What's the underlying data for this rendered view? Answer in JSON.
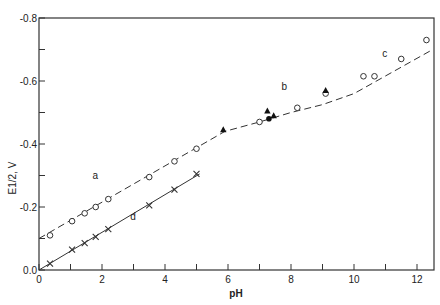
{
  "chart_data": {
    "type": "scatter",
    "title": "",
    "xlabel": "pH",
    "ylabel": "E1/2, V",
    "xlim": [
      0,
      12.5
    ],
    "ylim": [
      0.0,
      -0.8
    ],
    "x_ticks": [
      0,
      2,
      4,
      6,
      8,
      10,
      12
    ],
    "x_minor_ticks": [
      1,
      3,
      5,
      7,
      9,
      11
    ],
    "y_ticks": [
      "0.0",
      "-0.2",
      "-0.4",
      "-0.6",
      "-0.8"
    ],
    "y_tick_values": [
      0.0,
      -0.2,
      -0.4,
      -0.6,
      -0.8
    ],
    "y_minor_ticks": [
      -0.1,
      -0.3,
      -0.5,
      -0.7
    ],
    "grid": false,
    "annotations": [
      {
        "text": "a",
        "x": 1.7,
        "y": -0.29
      },
      {
        "text": "b",
        "x": 7.7,
        "y": -0.57
      },
      {
        "text": "c",
        "x": 10.9,
        "y": -0.675
      },
      {
        "text": "d",
        "x": 2.9,
        "y": -0.16
      }
    ],
    "series": [
      {
        "name": "a",
        "marker": "open-circle",
        "x": [
          0.35,
          1.05,
          1.45,
          1.8,
          2.2,
          3.5,
          4.3,
          5.0
        ],
        "y": [
          -0.11,
          -0.155,
          -0.18,
          -0.2,
          -0.225,
          -0.295,
          -0.345,
          -0.385
        ]
      },
      {
        "name": "d",
        "marker": "cross",
        "x": [
          0.35,
          1.05,
          1.45,
          1.8,
          2.2,
          3.5,
          4.3,
          5.0
        ],
        "y": [
          -0.02,
          -0.065,
          -0.085,
          -0.105,
          -0.13,
          -0.205,
          -0.255,
          -0.305
        ]
      },
      {
        "name": "b-circles",
        "marker": "open-circle",
        "x": [
          7.0,
          8.2,
          9.1
        ],
        "y": [
          -0.47,
          -0.515,
          -0.56
        ]
      },
      {
        "name": "b-triangles",
        "marker": "filled-triangle",
        "x": [
          5.85,
          7.25,
          7.45,
          9.1
        ],
        "y": [
          -0.445,
          -0.505,
          -0.49,
          -0.57
        ]
      },
      {
        "name": "b-filled-circle",
        "marker": "filled-circle",
        "x": [
          7.3
        ],
        "y": [
          -0.48
        ]
      },
      {
        "name": "c",
        "marker": "open-circle",
        "x": [
          10.3,
          10.65,
          11.5,
          12.3
        ],
        "y": [
          -0.615,
          -0.615,
          -0.67,
          -0.73
        ]
      }
    ],
    "lines": [
      {
        "name": "fit-a-b-c",
        "style": "dashed",
        "x": [
          0,
          5.9,
          7.0,
          8.0,
          9.0,
          10.0,
          12.5
        ],
        "y": [
          -0.1,
          -0.44,
          -0.47,
          -0.5,
          -0.525,
          -0.56,
          -0.7
        ]
      },
      {
        "name": "fit-d",
        "style": "solid",
        "x": [
          0,
          5.1
        ],
        "y": [
          0.0,
          -0.305
        ]
      }
    ]
  }
}
